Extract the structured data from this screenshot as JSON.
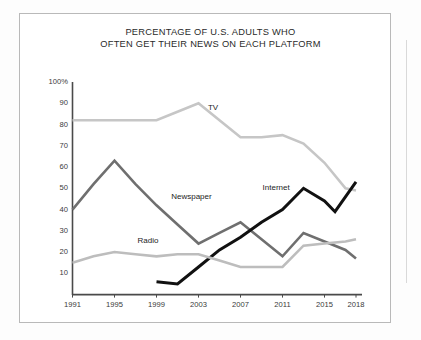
{
  "chart_data": {
    "type": "line",
    "title": "PERCENTAGE OF U.S. ADULTS WHO\nOFTEN GET THEIR NEWS ON EACH PLATFORM",
    "xlabel": "",
    "ylabel": "",
    "xlim": [
      1991,
      2018
    ],
    "ylim": [
      0,
      100
    ],
    "grid": false,
    "legend_position": "inline-labels",
    "y_ticks": [
      "100%",
      "90",
      "80",
      "70",
      "60",
      "50",
      "40",
      "30",
      "20",
      "10"
    ],
    "y_tick_values": [
      100,
      90,
      80,
      70,
      60,
      50,
      40,
      30,
      20,
      10
    ],
    "x_ticks": [
      "1991",
      "1995",
      "1999",
      "2003",
      "2007",
      "2011",
      "2015",
      "2018"
    ],
    "x_tick_values": [
      1991,
      1995,
      1999,
      2003,
      2007,
      2011,
      2015,
      2018
    ],
    "series": [
      {
        "name": "TV",
        "color": "#c6c6c6",
        "label_x": 2003.9,
        "label_y": 88,
        "x": [
          1991,
          1993,
          1995,
          1997,
          1999,
          2001,
          2003,
          2005,
          2007,
          2009,
          2011,
          2013,
          2015,
          2017,
          2018
        ],
        "values": [
          82,
          82,
          82,
          82,
          82,
          86,
          90,
          82,
          74,
          74,
          75,
          71,
          62,
          50,
          49
        ]
      },
      {
        "name": "Newspaper",
        "color": "#6f6f6f",
        "label_x": 2000.4,
        "label_y": 46,
        "x": [
          1991,
          1993,
          1995,
          1997,
          1999,
          2001,
          2003,
          2005,
          2007,
          2009,
          2011,
          2013,
          2015,
          2017,
          2018
        ],
        "values": [
          40,
          52,
          63,
          52,
          42,
          33,
          24,
          29,
          34,
          26,
          18,
          29,
          25,
          21,
          17
        ]
      },
      {
        "name": "Internet",
        "color": "#111111",
        "label_x": 2009.1,
        "label_y": 50,
        "x": [
          1999,
          2001,
          2003,
          2005,
          2007,
          2009,
          2011,
          2013,
          2015,
          2016,
          2018
        ],
        "values": [
          6,
          5,
          13,
          21,
          27,
          34,
          40,
          50,
          44,
          39,
          53
        ]
      },
      {
        "name": "Radio",
        "color": "#bdbdbd",
        "label_x": 1997.2,
        "label_y": 25,
        "x": [
          1991,
          1993,
          1995,
          1997,
          1999,
          2001,
          2003,
          2005,
          2007,
          2009,
          2011,
          2013,
          2015,
          2017,
          2018
        ],
        "values": [
          15,
          18,
          20,
          19,
          18,
          19,
          19,
          16,
          13,
          13,
          13,
          23,
          24,
          25,
          26
        ]
      }
    ]
  }
}
